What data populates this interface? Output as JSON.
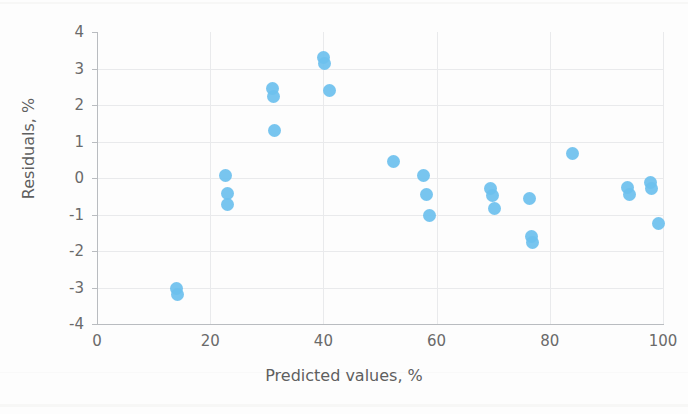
{
  "chart_data": {
    "type": "scatter",
    "title": "",
    "xlabel": "Predicted values, %",
    "ylabel": "Residuals, %",
    "xlim": [
      0,
      100
    ],
    "ylim": [
      -4,
      4
    ],
    "xticks": [
      0,
      20,
      40,
      60,
      80,
      100
    ],
    "yticks": [
      4,
      3,
      2,
      1,
      0,
      -1,
      -2,
      -3,
      -4
    ],
    "xtick_labels": [
      "0",
      "20",
      "40",
      "60",
      "80",
      "100"
    ],
    "ytick_labels": [
      "4",
      "3",
      "2",
      "1",
      "0",
      "-1",
      "-2",
      "-3",
      "-4"
    ],
    "grid": true,
    "legend": false,
    "marker_color": "#6cc0ee",
    "marker_shape": "circle",
    "series": [
      {
        "name": "Residuals",
        "points": [
          [
            14.0,
            -3.02
          ],
          [
            14.2,
            -3.18
          ],
          [
            22.7,
            0.08
          ],
          [
            23.0,
            -0.42
          ],
          [
            23.0,
            -0.72
          ],
          [
            31.0,
            2.46
          ],
          [
            31.2,
            2.24
          ],
          [
            31.4,
            1.3
          ],
          [
            40.0,
            3.3
          ],
          [
            40.2,
            3.14
          ],
          [
            41.0,
            2.4
          ],
          [
            52.3,
            0.44
          ],
          [
            57.6,
            0.08
          ],
          [
            58.2,
            -0.44
          ],
          [
            58.8,
            -1.04
          ],
          [
            69.6,
            -0.28
          ],
          [
            69.8,
            -0.48
          ],
          [
            70.2,
            -0.84
          ],
          [
            76.4,
            -0.56
          ],
          [
            76.8,
            -1.6
          ],
          [
            76.9,
            -1.78
          ],
          [
            84.0,
            0.66
          ],
          [
            93.8,
            -0.26
          ],
          [
            94.0,
            -0.44
          ],
          [
            97.8,
            -0.12
          ],
          [
            98.0,
            -0.28
          ],
          [
            99.2,
            -1.26
          ]
        ]
      }
    ]
  },
  "axis": {
    "x_title": "Predicted values, %",
    "y_title": "Residuals, %"
  }
}
